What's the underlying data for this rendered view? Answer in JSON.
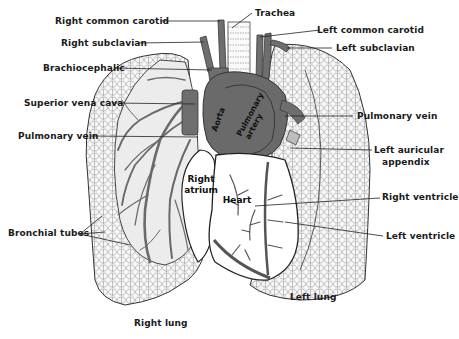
{
  "colors": {
    "vessel": "#6e6e6e",
    "vessel_dark": "#4a4a4a",
    "lung_fill": "#f4f4f4",
    "line": "#222222",
    "background": "#ffffff"
  },
  "labels": {
    "right_common_carotid": "Right common carotid",
    "trachea": "Trachea",
    "left_common_carotid": "Left common carotid",
    "right_subclavian": "Right subclavian",
    "left_subclavian": "Left subclavian",
    "brachiocephalic": "Brachiocephalic",
    "superior_vena_cava": "Superior vena cava",
    "pulmonary_vein_right": "Pulmonary vein",
    "pulmonary_vein_left": "Pulmonary vein",
    "left_auricular_appendix_1": "Left auricular",
    "left_auricular_appendix_2": "appendix",
    "right_ventricle": "Right ventricle",
    "left_ventricle": "Left ventricle",
    "bronchial_tubes": "Bronchial tubes",
    "right_lung": "Right lung",
    "left_lung": "Left lung"
  },
  "inner_labels": {
    "aorta": "Aorta",
    "pulmonary_artery_1": "Pulmonary",
    "pulmonary_artery_2": "artery",
    "right_atrium_1": "Right",
    "right_atrium_2": "atrium",
    "heart": "Heart"
  }
}
